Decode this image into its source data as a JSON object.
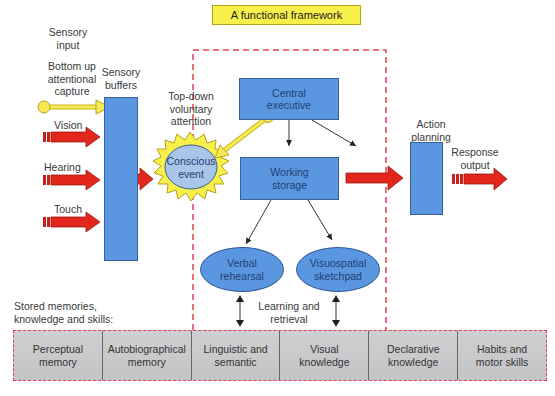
{
  "title": "A functional framework",
  "left_labels": {
    "sensory_input": [
      "Sensory",
      "input"
    ],
    "bottom_up": [
      "Bottom up",
      "attentional",
      "capture"
    ],
    "sensory_buffers": [
      "Sensory",
      "buffers"
    ],
    "vision": "Vision",
    "hearing": "Hearing",
    "touch": "Touch"
  },
  "top_down": [
    "Top-down",
    "voluntary",
    "attention"
  ],
  "conscious_event": [
    "Conscious",
    "event"
  ],
  "central_executive": [
    "Central",
    "executive"
  ],
  "working_storage": [
    "Working",
    "storage"
  ],
  "verbal_rehearsal": [
    "Verbal",
    "rehearsal"
  ],
  "visuospatial_sketchpad": [
    "Visuospatial",
    "sketchpad"
  ],
  "learning_retrieval": [
    "Learning and",
    "retrieval"
  ],
  "action_planning": [
    "Action",
    "planning"
  ],
  "response_output": [
    "Response",
    "output"
  ],
  "stored_memories_label": [
    "Stored memories,",
    "knowledge and skills:"
  ],
  "memories": [
    [
      "Perceptual",
      "memory"
    ],
    [
      "Autobiographical",
      "memory"
    ],
    [
      "Linguistic and",
      "semantic"
    ],
    [
      "Visual",
      "knowledge"
    ],
    [
      "Declarative",
      "knowledge"
    ],
    [
      "Habits and",
      "motor skills"
    ]
  ],
  "colors": {
    "box_blue": "#5b97e0",
    "arrow_red": "#e3261b",
    "dashed_red": "#e24050",
    "yellow": "#f7ef4a",
    "memory_gray": "#c9c9cb"
  }
}
